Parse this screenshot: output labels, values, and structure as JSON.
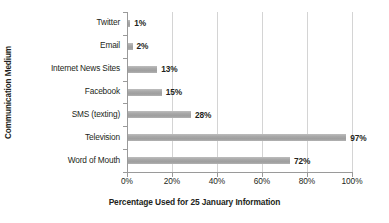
{
  "chart_data": {
    "type": "bar",
    "orientation": "horizontal",
    "title": "",
    "xlabel": "Percentage Used for 25 January Information",
    "ylabel": "Communication Medium",
    "categories": [
      "Twitter",
      "Email",
      "Internet News Sites",
      "Facebook",
      "SMS (texting)",
      "Television",
      "Word of Mouth"
    ],
    "values": [
      1,
      2,
      13,
      15,
      28,
      97,
      72
    ],
    "value_labels": [
      "1%",
      "2%",
      "13%",
      "15%",
      "28%",
      "97%",
      "72%"
    ],
    "xlim": [
      0,
      100
    ],
    "xticks": [
      0,
      20,
      40,
      60,
      80,
      100
    ],
    "xticklabels": [
      "0%",
      "20%",
      "40%",
      "60%",
      "80%",
      "100%"
    ],
    "grid": "vertical",
    "legend": "none",
    "bar_color": "#a6a6a6",
    "axis_color": "#9a9a9a",
    "gridline_color": "#d4d4d4",
    "text_color": "#231f20",
    "background": "#ffffff"
  }
}
